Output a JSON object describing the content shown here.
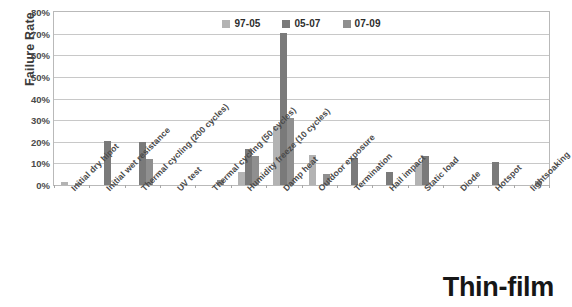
{
  "chart_data": {
    "type": "bar",
    "title": "",
    "subtitle": "",
    "xlabel": "",
    "ylabel": "Failure Rate",
    "ylim": [
      0,
      80
    ],
    "ytick_labels": [
      "0%",
      "10%",
      "20%",
      "30%",
      "40%",
      "50%",
      "60%",
      "70%",
      "80%"
    ],
    "ytick_values": [
      0,
      10,
      20,
      30,
      40,
      50,
      60,
      70,
      80
    ],
    "grid": true,
    "legend_position": "top-center",
    "categories": [
      "Initial dry hipot",
      "Initial wet resistance",
      "Thermal cycling (200 cycles)",
      "UV test",
      "Thermal cycling (50 cycles)",
      "Humidity freeze (10 cycles)",
      "Damp heat",
      "Outdoor exposure",
      "Termination",
      "Hail impact",
      "Static load",
      "Diode",
      "Hotspot",
      "lightsoaking"
    ],
    "series": [
      {
        "name": "97-05",
        "color": "#b3b3b3",
        "values": [
          1.2,
          0,
          0,
          0,
          0,
          5.8,
          27.5,
          14.0,
          0,
          0,
          9.5,
          0,
          0,
          0
        ]
      },
      {
        "name": "05-07",
        "color": "#7a7a7a",
        "values": [
          0,
          20.2,
          20.0,
          0,
          0,
          16.5,
          70.2,
          0,
          12.4,
          6.2,
          13.5,
          0,
          10.8,
          0
        ]
      },
      {
        "name": "07-09",
        "color": "#8f8f8f",
        "values": [
          0.9,
          0.7,
          12.0,
          0,
          2.2,
          13.5,
          31.0,
          5.2,
          0,
          0,
          0,
          0,
          0,
          1.8
        ]
      }
    ],
    "annotation": "Thin-film"
  },
  "colors": {
    "axis": "#b9b9b9",
    "grid": "#c8c8c8",
    "text": "#4a4a4a",
    "caption": "#161616"
  }
}
